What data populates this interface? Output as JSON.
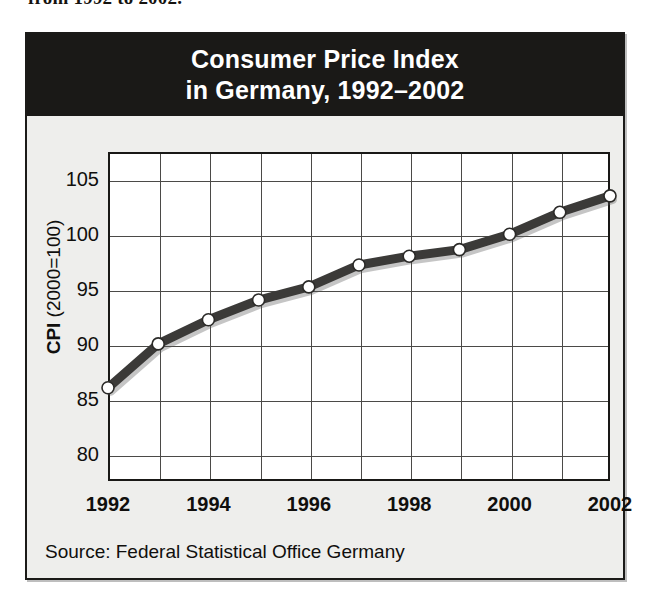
{
  "page": {
    "cut_off_text": "from 1992 to 2002."
  },
  "figure": {
    "title_line1": "Consumer Price Index",
    "title_line2": "in Germany, 1992–2002",
    "source": "Source: Federal Statistical Office Germany",
    "colors": {
      "banner_background": "#1a1917",
      "banner_text": "#ffffff",
      "figure_background": "#eeeeec",
      "plot_background": "#ffffff",
      "frame_line": "#191816",
      "grid_line": "#4b4a47",
      "series_line": "#3b3a38",
      "marker_fill": "#ffffff",
      "marker_stroke": "#2b2a28"
    }
  },
  "chart_data": {
    "type": "line",
    "title": "Consumer Price Index in Germany, 1992–2002",
    "subtitle": "",
    "xlabel": "",
    "ylabel": "CPI (2000=100)",
    "ylabel_bold_prefix": "CPI",
    "ylabel_rest": " (2000=100)",
    "x": [
      1992,
      1993,
      1994,
      1995,
      1996,
      1997,
      1998,
      1999,
      2000,
      2001,
      2002
    ],
    "values": [
      86.0,
      90.0,
      92.2,
      94.0,
      95.2,
      97.2,
      98.0,
      98.6,
      100.0,
      102.0,
      103.5
    ],
    "series": [
      {
        "name": "CPI (2000=100)",
        "values": [
          86.0,
          90.0,
          92.2,
          94.0,
          95.2,
          97.2,
          98.0,
          98.6,
          100.0,
          102.0,
          103.5
        ]
      }
    ],
    "xlim": [
      1992,
      2002
    ],
    "ylim": [
      77.5,
      107.5
    ],
    "yticks": [
      80,
      85,
      90,
      95,
      100,
      105
    ],
    "ytick_labels": [
      "80",
      "85",
      "90",
      "95",
      "100",
      "105"
    ],
    "xticks": [
      1992,
      1994,
      1996,
      1998,
      2000,
      2002
    ],
    "xtick_labels": [
      "1992",
      "1994",
      "1996",
      "1998",
      "2000",
      "2002"
    ],
    "x_gridlines": [
      1993,
      1994,
      1995,
      1996,
      1997,
      1998,
      1999,
      2000,
      2001
    ],
    "grid": true,
    "legend": "none",
    "markers": "circle",
    "annotations": []
  }
}
